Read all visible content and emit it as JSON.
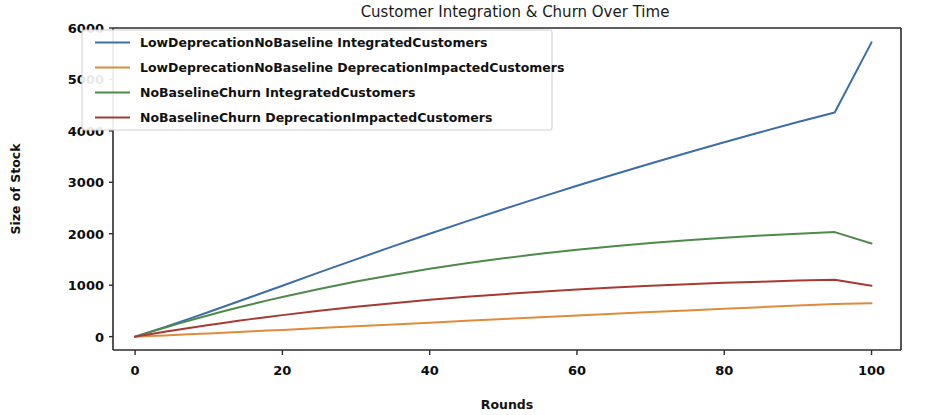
{
  "figure": {
    "width": 929,
    "height": 415,
    "background": "#ffffff",
    "plot_area": {
      "x": 113,
      "y": 28,
      "width": 788,
      "height": 322
    }
  },
  "chart_data": {
    "type": "line",
    "title": "Customer Integration & Churn Over Time",
    "xlabel": "Rounds",
    "ylabel": "Size of Stock",
    "xlim": [
      -3,
      104
    ],
    "ylim": [
      -260,
      6000
    ],
    "xticks": [
      0,
      20,
      40,
      60,
      80,
      100
    ],
    "xtick_labels": [
      "0",
      "20",
      "40",
      "60",
      "80",
      "100"
    ],
    "yticks": [
      0,
      1000,
      2000,
      3000,
      4000,
      5000,
      6000
    ],
    "ytick_labels": [
      "0",
      "1000",
      "2000",
      "3000",
      "4000",
      "5000",
      "6000"
    ],
    "grid": false,
    "legend_position": "upper left",
    "x": [
      0,
      2,
      4,
      6,
      8,
      10,
      12,
      14,
      16,
      18,
      20,
      25,
      30,
      35,
      40,
      45,
      50,
      55,
      60,
      65,
      70,
      75,
      80,
      85,
      90,
      95,
      100
    ],
    "series": [
      {
        "name": "LowDeprecationNoBaseline IntegratedCustomers",
        "color": "#3b6ea8",
        "values": [
          0,
          90,
          185,
          282,
          380,
          480,
          580,
          682,
          784,
          887,
          990,
          1248,
          1503,
          1754,
          2000,
          2241,
          2477,
          2708,
          2933,
          3153,
          3367,
          3576,
          3780,
          3978,
          4171,
          4359,
          5720
        ]
      },
      {
        "name": "LowDeprecationNoBaseline DeprecationImpactedCustomers",
        "color": "#e08b3c",
        "values": [
          0,
          12,
          24,
          37,
          50,
          63,
          76,
          90,
          103,
          117,
          131,
          166,
          201,
          237,
          272,
          307,
          342,
          377,
          411,
          445,
          478,
          510,
          542,
          573,
          603,
          632,
          650
        ]
      },
      {
        "name": "NoBaselineChurn IntegratedCustomers",
        "color": "#4e8a4a",
        "values": [
          0,
          88,
          174,
          257,
          338,
          416,
          492,
          565,
          636,
          705,
          771,
          927,
          1070,
          1200,
          1318,
          1425,
          1522,
          1609,
          1688,
          1758,
          1820,
          1875,
          1923,
          1965,
          2001,
          2032,
          1810
        ]
      },
      {
        "name": "NoBaselineChurn DeprecationImpactedCustomers",
        "color": "#a63a33",
        "values": [
          0,
          48,
          95,
          140,
          184,
          226,
          267,
          307,
          345,
          382,
          418,
          502,
          580,
          651,
          715,
          773,
          826,
          873,
          916,
          954,
          988,
          1018,
          1045,
          1068,
          1089,
          1107,
          990
        ]
      }
    ]
  },
  "legend": {
    "entries": [
      {
        "label": "LowDeprecationNoBaseline IntegratedCustomers",
        "color": "#3b6ea8"
      },
      {
        "label": "LowDeprecationNoBaseline DeprecationImpactedCustomers",
        "color": "#e08b3c"
      },
      {
        "label": "NoBaselineChurn IntegratedCustomers",
        "color": "#4e8a4a"
      },
      {
        "label": "NoBaselineChurn DeprecationImpactedCustomers",
        "color": "#a63a33"
      }
    ],
    "box": {
      "x": 82,
      "y": 30,
      "width": 470,
      "height": 100
    }
  }
}
